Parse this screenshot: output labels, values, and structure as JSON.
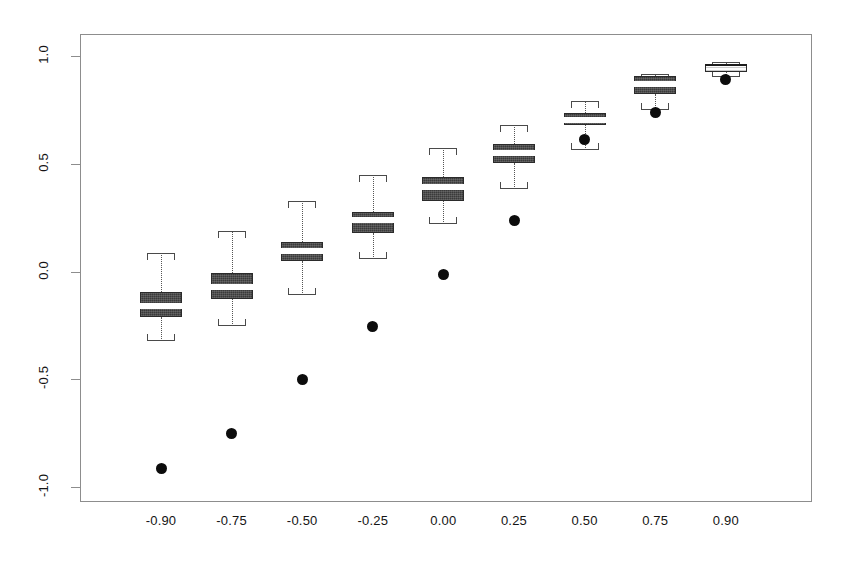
{
  "chart_data": {
    "type": "box",
    "title": "",
    "xlabel": "",
    "ylabel": "",
    "categories": [
      "-0.90",
      "-0.75",
      "-0.50",
      "-0.25",
      "0.00",
      "0.25",
      "0.50",
      "0.75",
      "0.90"
    ],
    "x_tick_labels": [
      "-0.90",
      "-0.75",
      "-0.50",
      "-0.25",
      "0.00",
      "0.25",
      "0.50",
      "0.75",
      "0.90"
    ],
    "y_tick_labels": [
      "-1.0",
      "-0.5",
      "0.0",
      "0.5",
      "1.0"
    ],
    "y_tick_values": [
      -1.0,
      -0.5,
      0.0,
      0.5,
      1.0
    ],
    "ylim": [
      -1.08,
      1.07
    ],
    "grid": false,
    "legend": null,
    "legend_position": "none",
    "frame": true,
    "box_fill_color": "#3a3a3a",
    "median_color": "#ffffff",
    "point_color": "#0c0c0c",
    "axis_color": "#8d8d8d",
    "boxes": [
      {
        "category": "-0.90",
        "whisker_low": -0.322,
        "q1": -0.211,
        "median": -0.16,
        "q3": -0.095,
        "whisker_high": 0.086,
        "reference_point": -0.912,
        "style": "dark"
      },
      {
        "category": "-0.75",
        "whisker_low": -0.253,
        "q1": -0.127,
        "median": -0.072,
        "q3": -0.007,
        "whisker_high": 0.188,
        "reference_point": -0.754,
        "style": "dark"
      },
      {
        "category": "-0.50",
        "whisker_low": -0.109,
        "q1": 0.047,
        "median": 0.093,
        "q3": 0.139,
        "whisker_high": 0.326,
        "reference_point": -0.503,
        "style": "dark"
      },
      {
        "category": "-0.25",
        "whisker_low": 0.058,
        "q1": 0.178,
        "median": 0.239,
        "q3": 0.275,
        "whisker_high": 0.447,
        "reference_point": -0.257,
        "style": "dark"
      },
      {
        "category": "0.00",
        "whisker_low": 0.22,
        "q1": 0.327,
        "median": 0.391,
        "q3": 0.438,
        "whisker_high": 0.573,
        "reference_point": -0.012,
        "style": "dark"
      },
      {
        "category": "0.25",
        "whisker_low": 0.382,
        "q1": 0.503,
        "median": 0.549,
        "q3": 0.591,
        "whisker_high": 0.679,
        "reference_point": 0.237,
        "style": "dark"
      },
      {
        "category": "0.50",
        "whisker_low": 0.563,
        "q1": 0.679,
        "median": 0.702,
        "q3": 0.735,
        "whisker_high": 0.789,
        "reference_point": 0.614,
        "style": "dark"
      },
      {
        "category": "0.75",
        "whisker_low": 0.749,
        "q1": 0.823,
        "median": 0.87,
        "q3": 0.907,
        "whisker_high": 0.916,
        "reference_point": 0.74,
        "style": "dark"
      },
      {
        "category": "0.90",
        "whisker_low": 0.903,
        "q1": 0.926,
        "median": 0.949,
        "q3": 0.963,
        "whisker_high": 0.972,
        "reference_point": 0.893,
        "style": "light"
      }
    ]
  }
}
